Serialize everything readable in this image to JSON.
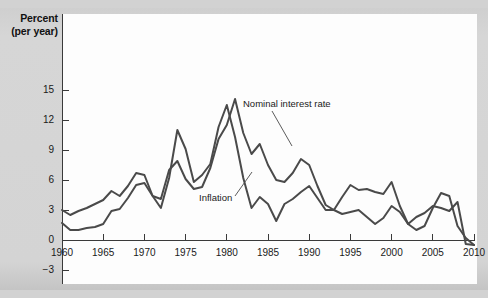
{
  "figure": {
    "y_axis_title_line1": "Percent",
    "y_axis_title_line2": "(per year)",
    "line_color": "#4a4a4a",
    "axis_color": "#3a3a3a",
    "panel_color": "#fdfdfd",
    "page_color": "#d2d2d2"
  },
  "chart_data": {
    "type": "line",
    "title": "",
    "xlabel": "",
    "ylabel": "Percent (per year)",
    "xlim": [
      1960,
      2010
    ],
    "ylim": [
      -3,
      15
    ],
    "yticks": [
      15,
      12,
      9,
      6,
      3,
      0,
      -3
    ],
    "xticks": [
      1960,
      1965,
      1970,
      1975,
      1980,
      1985,
      1990,
      1995,
      2000,
      2005,
      2010
    ],
    "grid": false,
    "legend_position": "annotations-inline",
    "annotations": [
      {
        "text": "Nominal interest rate",
        "series": "Nominal interest rate"
      },
      {
        "text": "Inflation",
        "series": "Inflation"
      }
    ],
    "x": [
      1960,
      1961,
      1962,
      1963,
      1964,
      1965,
      1966,
      1967,
      1968,
      1969,
      1970,
      1971,
      1972,
      1973,
      1974,
      1975,
      1976,
      1977,
      1978,
      1979,
      1980,
      1981,
      1982,
      1983,
      1984,
      1985,
      1986,
      1987,
      1988,
      1989,
      1990,
      1991,
      1992,
      1993,
      1994,
      1995,
      1996,
      1997,
      1998,
      1999,
      2000,
      2001,
      2002,
      2003,
      2004,
      2005,
      2006,
      2007,
      2008,
      2009,
      2010
    ],
    "series": [
      {
        "name": "Nominal interest rate",
        "values": [
          3.0,
          2.5,
          2.9,
          3.2,
          3.6,
          4.0,
          4.9,
          4.4,
          5.4,
          6.7,
          6.5,
          4.4,
          4.1,
          7.0,
          7.9,
          6.1,
          5.1,
          5.3,
          7.2,
          10.1,
          11.5,
          14.1,
          10.7,
          8.6,
          9.6,
          7.5,
          6.0,
          5.8,
          6.7,
          8.1,
          7.5,
          5.4,
          3.5,
          3.0,
          4.3,
          5.5,
          5.0,
          5.1,
          4.8,
          4.6,
          5.8,
          3.4,
          1.6,
          1.0,
          1.4,
          3.2,
          4.7,
          4.4,
          1.4,
          0.2,
          -0.5
        ]
      },
      {
        "name": "Inflation",
        "values": [
          1.7,
          1.0,
          1.0,
          1.2,
          1.3,
          1.6,
          2.9,
          3.1,
          4.2,
          5.5,
          5.7,
          4.4,
          3.2,
          6.2,
          11.0,
          9.1,
          5.8,
          6.5,
          7.6,
          11.3,
          13.5,
          10.3,
          6.2,
          3.2,
          4.3,
          3.6,
          1.9,
          3.6,
          4.1,
          4.8,
          5.4,
          4.2,
          3.0,
          3.0,
          2.6,
          2.8,
          3.0,
          2.3,
          1.6,
          2.2,
          3.4,
          2.8,
          1.6,
          2.3,
          2.7,
          3.4,
          3.2,
          2.9,
          3.8,
          -0.4,
          -0.5
        ]
      }
    ]
  }
}
